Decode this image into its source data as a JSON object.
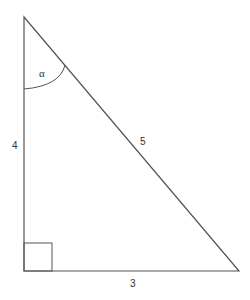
{
  "diagram": {
    "type": "right-triangle",
    "angle_label": "α",
    "sides": {
      "vertical": "4",
      "hypotenuse": "5",
      "horizontal": "3"
    },
    "colors": {
      "stroke": "#555555",
      "background": "#ffffff"
    }
  }
}
